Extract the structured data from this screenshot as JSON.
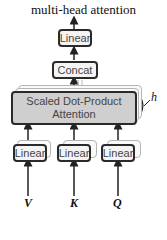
{
  "title": "multi-head attention",
  "blocks": {
    "linear_top": "Linear",
    "concat": "Concat",
    "sdpa_line1": "Scaled Dot-Product",
    "sdpa_line2": "Attention",
    "linear_v": "Linear",
    "linear_k": "Linear",
    "linear_q": "Linear"
  },
  "heads_label": "h",
  "inputs": [
    "V",
    "K",
    "Q"
  ],
  "colors": {
    "border": "#2a2a2a",
    "sdpa_fill": "#cfcfcf",
    "box_fill": "#f4f4f4",
    "shadow": "#b5b5b5"
  }
}
